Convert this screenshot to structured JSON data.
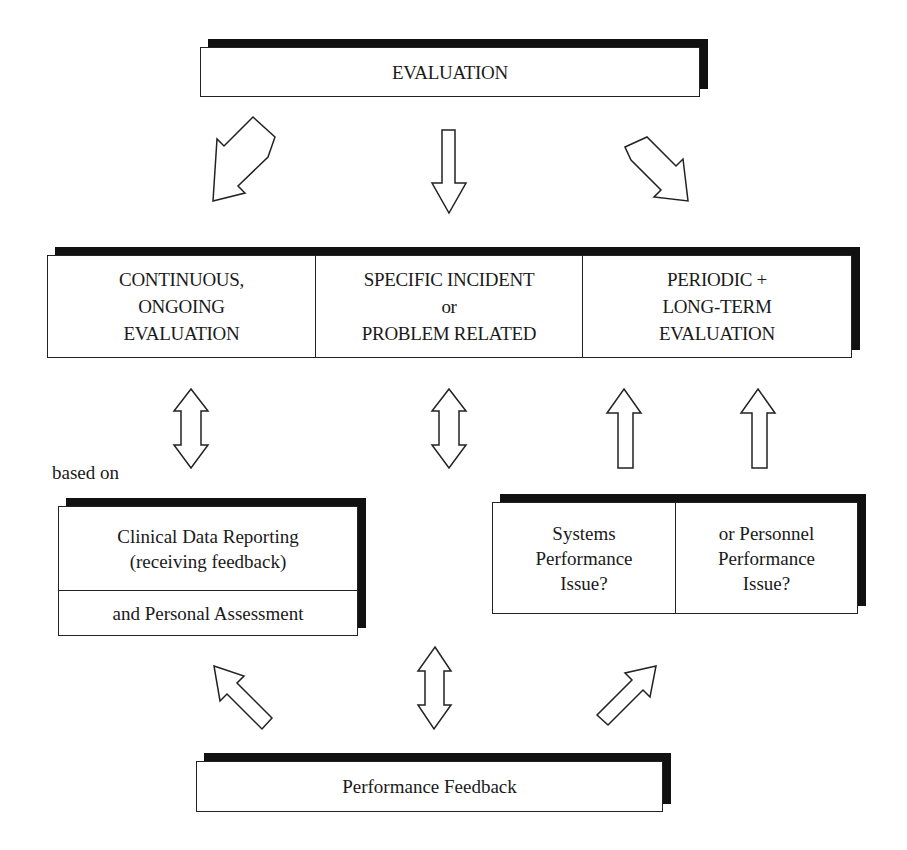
{
  "top": {
    "title": "EVALUATION"
  },
  "evaluation_types": [
    {
      "label": "CONTINUOUS,\nONGOING\nEVALUATION"
    },
    {
      "label": "SPECIFIC INCIDENT\nor\nPROBLEM RELATED"
    },
    {
      "label": "PERIODIC +\nLONG-TERM\nEVALUATION"
    }
  ],
  "left_branch": {
    "caption": "based on",
    "items": [
      {
        "label": "Clinical Data Reporting\n(receiving feedback)"
      },
      {
        "label": "and Personal Assessment"
      }
    ]
  },
  "right_branch": {
    "items": [
      {
        "label": "Systems\nPerformance\nIssue?"
      },
      {
        "label": "or Personnel\nPerformance\nIssue?"
      }
    ]
  },
  "bottom": {
    "title": "Performance Feedback"
  },
  "arrows": [
    {
      "name": "evaluation-to-continuous",
      "type": "single",
      "direction": "down-left"
    },
    {
      "name": "evaluation-to-specific",
      "type": "single",
      "direction": "down"
    },
    {
      "name": "evaluation-to-periodic",
      "type": "single",
      "direction": "down-right"
    },
    {
      "name": "continuous-clinical-data",
      "type": "double",
      "direction": "vertical"
    },
    {
      "name": "specific-feedback",
      "type": "double",
      "direction": "vertical"
    },
    {
      "name": "systems-to-periodic",
      "type": "single",
      "direction": "up"
    },
    {
      "name": "personnel-to-periodic",
      "type": "single",
      "direction": "up"
    },
    {
      "name": "feedback-to-clinical",
      "type": "single",
      "direction": "up-left"
    },
    {
      "name": "feedback-to-issues",
      "type": "single",
      "direction": "up-right"
    }
  ]
}
